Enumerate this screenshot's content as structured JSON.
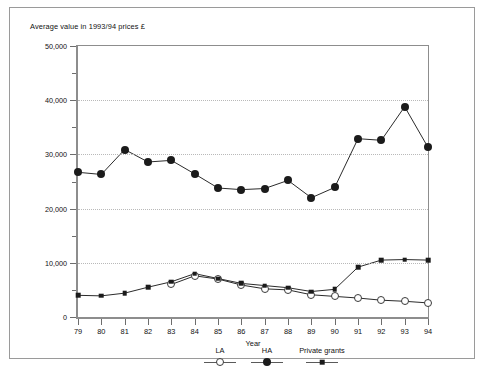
{
  "figure": {
    "axis_title": "Average value in 1993/94 prices £",
    "xaxis_name": "Year"
  },
  "chart_data": {
    "type": "line",
    "title": "Average value in 1993/94 prices £",
    "xlabel": "Year",
    "ylabel": "Average value in 1993/94 prices £",
    "categories": [
      "79",
      "80",
      "81",
      "82",
      "83",
      "84",
      "85",
      "86",
      "87",
      "88",
      "89",
      "90",
      "91",
      "92",
      "93",
      "94"
    ],
    "ylim": [
      0,
      50000
    ],
    "yticks": [
      0,
      10000,
      20000,
      30000,
      40000,
      50000
    ],
    "ytick_labels": [
      "0",
      "10,000",
      "20,000",
      "30,000",
      "40,000",
      "50,000"
    ],
    "yminor_ticks": [
      5000,
      15000,
      25000,
      35000,
      45000
    ],
    "grid": "horizontal-dotted",
    "legend_position": "bottom",
    "series": [
      {
        "name": "LA",
        "marker": "open-circle",
        "values": [
          null,
          null,
          null,
          null,
          6000,
          7600,
          7000,
          5900,
          5200,
          5000,
          4100,
          3800,
          3500,
          3100,
          2900,
          2600
        ]
      },
      {
        "name": "HA",
        "marker": "filled-circle",
        "values": [
          26700,
          26300,
          30900,
          28600,
          28900,
          26400,
          23800,
          23500,
          23700,
          25200,
          22000,
          23900,
          32900,
          32600,
          38800,
          31300
        ]
      },
      {
        "name": "Private grants",
        "marker": "filled-square",
        "values": [
          4000,
          3900,
          4400,
          5500,
          6500,
          8000,
          7100,
          6200,
          5800,
          5400,
          4700,
          5100,
          9200,
          10500,
          10600,
          10500
        ]
      }
    ]
  },
  "legend": {
    "items": [
      {
        "label": "LA",
        "marker": "open-circle"
      },
      {
        "label": "HA",
        "marker": "filled-circle"
      },
      {
        "label": "Private grants",
        "marker": "filled-square"
      }
    ]
  }
}
